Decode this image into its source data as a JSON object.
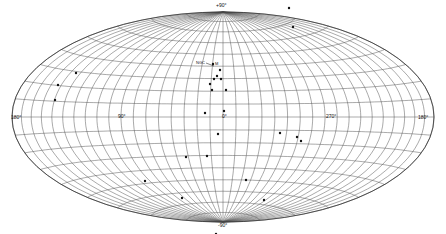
{
  "figure": {
    "projection": "Hammer-Aitoff all-sky",
    "labels": {
      "north_pole": "+90°",
      "south_pole": "-90°",
      "left_edge": "180°",
      "lon_left": "90°",
      "center": "0°",
      "lon_right": "270°",
      "right_edge": "180°",
      "cluster_label_a": "NGC",
      "cluster_label_b": "M"
    },
    "colors": {
      "grid": "#555555",
      "outline": "#333333",
      "point": "#111111"
    },
    "points": [
      [
        289,
        8
      ],
      [
        293,
        27
      ],
      [
        76,
        73
      ],
      [
        58,
        85
      ],
      [
        55,
        100
      ],
      [
        213,
        64
      ],
      [
        220,
        70
      ],
      [
        217,
        76
      ],
      [
        214,
        79
      ],
      [
        210,
        84
      ],
      [
        221,
        79
      ],
      [
        226,
        90
      ],
      [
        212,
        90
      ],
      [
        205,
        113
      ],
      [
        224,
        111
      ],
      [
        218,
        134
      ],
      [
        207,
        156
      ],
      [
        186,
        157
      ],
      [
        280,
        133
      ],
      [
        297,
        137
      ],
      [
        301,
        141
      ],
      [
        145,
        181
      ],
      [
        182,
        198
      ],
      [
        246,
        180
      ],
      [
        264,
        200
      ],
      [
        216,
        234
      ]
    ]
  }
}
